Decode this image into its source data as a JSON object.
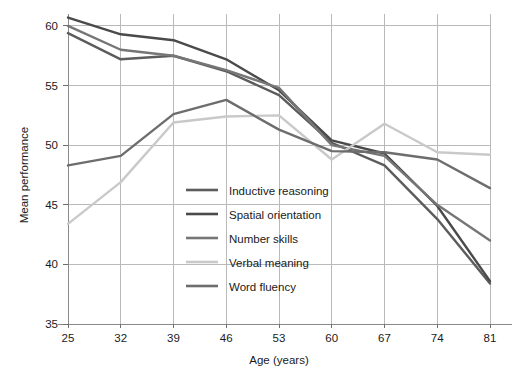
{
  "chart_data": {
    "type": "line",
    "title": "",
    "xlabel": "Age (years)",
    "ylabel": "Mean performance",
    "x": [
      25,
      32,
      39,
      46,
      53,
      60,
      67,
      74,
      81
    ],
    "xtick_labels": [
      "25",
      "32",
      "39",
      "46",
      "53",
      "60",
      "67",
      "74",
      "81"
    ],
    "ytick_labels": [
      "35",
      "40",
      "45",
      "50",
      "55",
      "60"
    ],
    "yticks": [
      35,
      40,
      45,
      50,
      55,
      60
    ],
    "xlim": [
      25,
      81
    ],
    "ylim": [
      35,
      61
    ],
    "grid": true,
    "legend_position": "center",
    "series": [
      {
        "name": "Inductive reasoning",
        "color": "#5c5c5c",
        "values": [
          59.4,
          57.2,
          57.5,
          56.2,
          54.2,
          50.2,
          48.3,
          43.8,
          38.4
        ]
      },
      {
        "name": "Spatial orientation",
        "color": "#4a4a4a",
        "values": [
          60.7,
          59.3,
          58.8,
          57.2,
          54.6,
          50.4,
          49.3,
          44.9,
          38.6
        ]
      },
      {
        "name": "Number skills",
        "color": "#767676",
        "values": [
          60.0,
          58.0,
          57.5,
          56.3,
          54.8,
          50.0,
          49.1,
          45.0,
          42.0
        ]
      },
      {
        "name": "Verbal meaning",
        "color": "#c9c9c9",
        "values": [
          43.4,
          46.9,
          51.9,
          52.4,
          52.5,
          48.8,
          51.8,
          49.4,
          49.2
        ]
      },
      {
        "name": "Word fluency",
        "color": "#6d6d6d",
        "values": [
          48.3,
          49.1,
          52.6,
          53.8,
          51.3,
          49.5,
          49.4,
          48.8,
          46.4
        ]
      }
    ]
  },
  "legend": {
    "items": [
      {
        "label": "Inductive reasoning"
      },
      {
        "label": "Spatial orientation"
      },
      {
        "label": "Number skills"
      },
      {
        "label": "Verbal meaning"
      },
      {
        "label": "Word fluency"
      }
    ]
  },
  "axes": {
    "y_title": "Mean performance",
    "x_title": "Age (years)"
  }
}
